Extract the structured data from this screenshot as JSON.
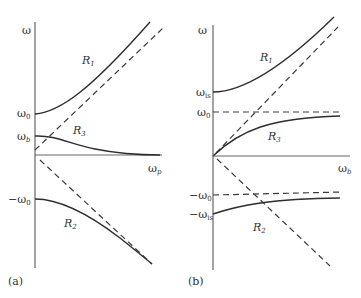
{
  "panels": [
    {
      "id": "a",
      "caption": "(a)",
      "y_axis_label": "ω",
      "x_axis_label": "ω",
      "x_axis_sub": "p",
      "tick_labels": {
        "w0": {
          "main": "ω",
          "sub": "0"
        },
        "wb": {
          "main": "ω",
          "sub": "b"
        },
        "neg_w0": {
          "main": "−ω",
          "sub": "0"
        }
      },
      "branches": [
        {
          "main": "R",
          "sub": "1"
        },
        {
          "main": "R",
          "sub": "3"
        },
        {
          "main": "R",
          "sub": "2"
        }
      ]
    },
    {
      "id": "b",
      "caption": "(b)",
      "y_axis_label": "ω",
      "x_axis_label": "ω",
      "x_axis_sub": "b",
      "tick_labels": {
        "wis": {
          "main": "ω",
          "sub": "is"
        },
        "w0": {
          "main": "ω",
          "sub": "0"
        },
        "neg_w0": {
          "main": "−ω",
          "sub": "0"
        },
        "neg_wis": {
          "main": "−ω",
          "sub": "is"
        }
      },
      "branches": [
        {
          "main": "R",
          "sub": "1"
        },
        {
          "main": "R",
          "sub": "3"
        },
        {
          "main": "R",
          "sub": "2"
        }
      ]
    }
  ],
  "colors": {
    "curve": "#2e2e2e",
    "axis": "#555555",
    "dash": "#3a3a3a"
  }
}
